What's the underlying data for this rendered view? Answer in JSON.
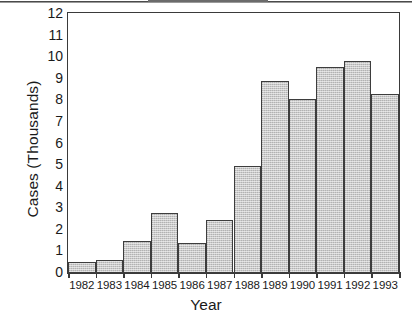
{
  "chart_data": {
    "type": "bar",
    "title": "",
    "xlabel": "Year",
    "ylabel": "Cases (Thousands)",
    "categories": [
      "1982",
      "1983",
      "1984",
      "1985",
      "1986",
      "1987",
      "1988",
      "1989",
      "1990",
      "1991",
      "1992",
      "1993"
    ],
    "values": [
      0.5,
      0.6,
      1.5,
      2.8,
      1.4,
      2.45,
      4.95,
      8.9,
      8.05,
      9.55,
      9.8,
      8.3
    ],
    "ylim": [
      0,
      12
    ],
    "ytick_labels": [
      "0",
      "1",
      "2",
      "3",
      "4",
      "5",
      "6",
      "7",
      "8",
      "9",
      "10",
      "11",
      "12"
    ],
    "ytick_values": [
      0,
      1,
      2,
      3,
      4,
      5,
      6,
      7,
      8,
      9,
      10,
      11,
      12
    ],
    "grid": false,
    "legend": "none",
    "bar_fill_color": "#c9c9c9",
    "bar_edge_color": "#3d3d3d",
    "axis_color": "#3a3a3a",
    "background_color": "#ffffff"
  }
}
